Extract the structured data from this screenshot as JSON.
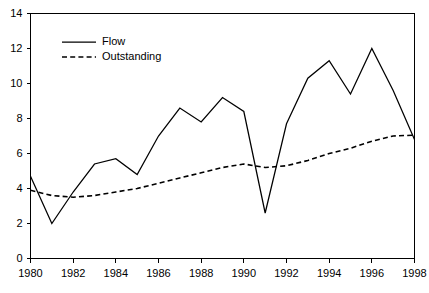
{
  "chart_data": {
    "type": "line",
    "title": "",
    "xlabel": "",
    "ylabel": "",
    "xlim": [
      1980,
      1998
    ],
    "ylim": [
      0,
      14
    ],
    "grid": false,
    "legend_position": "top-left",
    "x": [
      1980,
      1981,
      1982,
      1983,
      1984,
      1985,
      1986,
      1987,
      1988,
      1989,
      1990,
      1991,
      1992,
      1993,
      1994,
      1995,
      1996,
      1997,
      1998
    ],
    "xticks": [
      1980,
      1982,
      1984,
      1986,
      1988,
      1990,
      1992,
      1994,
      1996,
      1998
    ],
    "xtick_labels": [
      "1980",
      "1982",
      "1984",
      "1986",
      "1988",
      "1990",
      "1992",
      "1994",
      "1996",
      "1998"
    ],
    "yticks": [
      0,
      2,
      4,
      6,
      8,
      10,
      12,
      14
    ],
    "ytick_labels": [
      "0",
      "2",
      "4",
      "6",
      "8",
      "10",
      "12",
      "14"
    ],
    "series": [
      {
        "name": "Flow",
        "style": "solid",
        "color": "#000000",
        "values": [
          4.7,
          2.0,
          3.8,
          5.4,
          5.7,
          4.8,
          7.0,
          8.6,
          7.8,
          9.2,
          8.4,
          2.6,
          7.7,
          10.3,
          11.3,
          9.4,
          12.0,
          9.6,
          6.8
        ]
      },
      {
        "name": "Outstanding",
        "style": "dashed",
        "color": "#000000",
        "values": [
          3.9,
          3.6,
          3.5,
          3.6,
          3.8,
          4.0,
          4.3,
          4.6,
          4.9,
          5.2,
          5.4,
          5.2,
          5.3,
          5.6,
          6.0,
          6.3,
          6.7,
          7.0,
          7.05
        ]
      }
    ],
    "legend": [
      {
        "label": "Flow",
        "style": "solid"
      },
      {
        "label": "Outstanding",
        "style": "dashed"
      }
    ]
  }
}
